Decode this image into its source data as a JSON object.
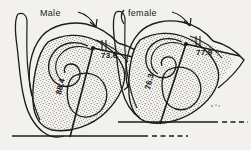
{
  "figure": {
    "title_alt": "Comparative male and female pelvis outlines with subpubic angle measurements",
    "background_color": "#f2f1ee",
    "ink_color": "#1b1b1b",
    "style": "vintage line engraving with stipple shading"
  },
  "specimens": [
    {
      "id": "male",
      "label": "Male",
      "label_position": {
        "x": 40,
        "y": 16
      },
      "measurements": [
        {
          "name": "upper-angle",
          "value": "73.6",
          "orientation": "horizontal",
          "x": 101,
          "y": 58
        },
        {
          "name": "lower-angle",
          "value": "88.4",
          "orientation": "rotated",
          "x": 61,
          "y": 95
        }
      ]
    },
    {
      "id": "female",
      "label": "female",
      "label_position": {
        "x": 128,
        "y": 16
      },
      "measurements": [
        {
          "name": "upper-angle",
          "value": "77.9",
          "orientation": "horizontal",
          "x": 196,
          "y": 55
        },
        {
          "name": "lower-angle",
          "value": "76.3",
          "orientation": "rotated",
          "x": 150,
          "y": 90
        }
      ]
    }
  ],
  "baselines": [
    {
      "name": "male-baseline",
      "solid_from": 12,
      "solid_to": 148,
      "dashed_from": 152,
      "dashed_to": 188,
      "y": 136
    },
    {
      "name": "female-baseline",
      "solid_from": 118,
      "solid_to": 218,
      "dashed_from": 222,
      "dashed_to": 248,
      "y": 122
    }
  ]
}
